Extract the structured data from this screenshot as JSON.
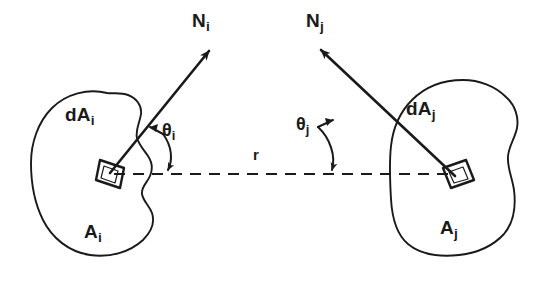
{
  "figure": {
    "type": "technical-line-diagram",
    "background_color": "#ffffff",
    "ink_color": "#1a1a1a"
  },
  "labels": {
    "normal_i": {
      "base": "N",
      "sub": "i"
    },
    "normal_j": {
      "base": "N",
      "sub": "j"
    },
    "diff_area_i": {
      "base": "dA",
      "sub": "i"
    },
    "diff_area_j": {
      "base": "dA",
      "sub": "j"
    },
    "angle_i": {
      "base": "θ",
      "sub": "i"
    },
    "angle_j": {
      "base": "θ",
      "sub": "j"
    },
    "surface_i": {
      "base": "A",
      "sub": "i"
    },
    "surface_j": {
      "base": "A",
      "sub": "j"
    },
    "distance": {
      "base": "r",
      "sub": ""
    }
  },
  "geometry": {
    "surface_i_blob": "irregular closed curve, left side, spanning roughly x 30-170, y 90-255",
    "surface_j_blob": "irregular closed curve, right side, spanning roughly x 378-520, y 80-255",
    "dA_i_patch": "small quadrilateral patch centered near (112,172) on surface i",
    "dA_j_patch": "small quadrilateral patch centered near (455,175) on surface j",
    "normal_i_arrow": "solid arrow from (112,172) up-right to (212,48)",
    "normal_j_arrow": "solid arrow from (455,175) up-left to (318,47)",
    "connector_r": "horizontal dashed line from (112,174) to (455,174)",
    "angle_i_arc": "curved arc with arrowhead from normal i line to the dashed line, near (150,150)",
    "angle_j_arc": "curved arc with arrowhead from normal j line to the dashed line, near (330,150)"
  }
}
